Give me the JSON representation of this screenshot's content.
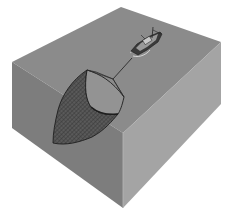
{
  "diagram": {
    "colors": {
      "background": "#ffffff",
      "top_face": "#8b8b8b",
      "left_face": "#7d7d7d",
      "right_face": "#a4a4a4",
      "net_fill": "#555555",
      "net_mouth": "#939393",
      "line": "#2a2a2a",
      "boat_hull": "#3a3a3a",
      "boat_deck": "#9a9a9a",
      "wake": "#e6e6e6"
    },
    "elements": {
      "water_block": "water-block",
      "boat": "fishing-boat",
      "tow_line": "tow-line",
      "net": "trawl-net"
    }
  }
}
